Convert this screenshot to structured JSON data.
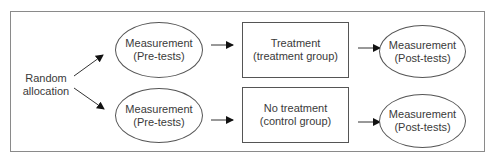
{
  "diagram": {
    "start": {
      "line1": "Random",
      "line2": "allocation"
    },
    "rows": [
      {
        "pretest": {
          "line1": "Measurement",
          "line2": "(Pre-tests)"
        },
        "intervention": {
          "line1": "Treatment",
          "line2": "(treatment group)"
        },
        "posttest": {
          "line1": "Measurement",
          "line2": "(Post-tests)"
        }
      },
      {
        "pretest": {
          "line1": "Measurement",
          "line2": "(Pre-tests)"
        },
        "intervention": {
          "line1": "No treatment",
          "line2": "(control group)"
        },
        "posttest": {
          "line1": "Measurement",
          "line2": "(Post-tests)"
        }
      }
    ],
    "colors": {
      "stroke": "#555555",
      "frame": "#8a8a8a",
      "text": "#3a3a3a"
    }
  }
}
